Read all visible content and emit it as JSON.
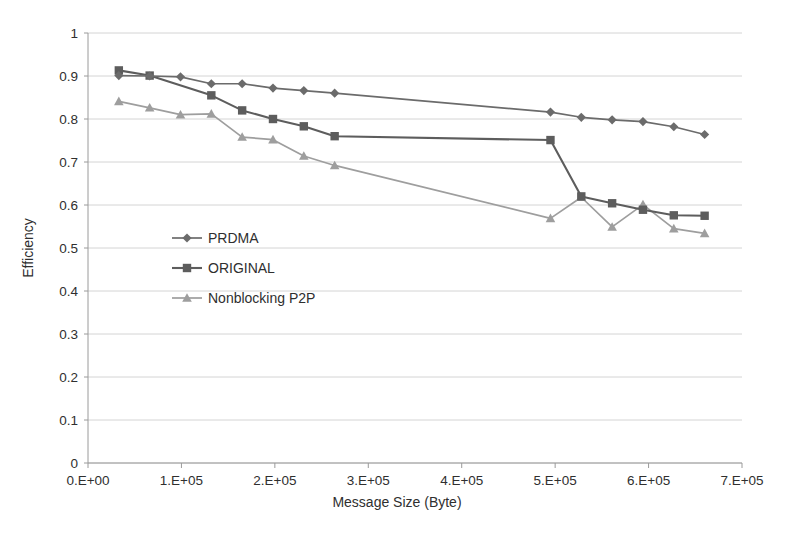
{
  "chart_data": {
    "type": "line",
    "title": "",
    "xlabel": "Message Size (Byte)",
    "ylabel": "Efficiency",
    "xlim": [
      0,
      700000
    ],
    "ylim": [
      0,
      1
    ],
    "grid": true,
    "legend_position": "inside-left-middle",
    "x_tick_labels": [
      "0.E+00",
      "1.E+05",
      "2.E+05",
      "3.E+05",
      "4.E+05",
      "5.E+05",
      "6.E+05",
      "7.E+05"
    ],
    "x_tick_values": [
      0,
      100000,
      200000,
      300000,
      400000,
      500000,
      600000,
      700000
    ],
    "y_tick_labels": [
      "0",
      "0.1",
      "0.2",
      "0.3",
      "0.4",
      "0.5",
      "0.6",
      "0.7",
      "0.8",
      "0.9",
      "1"
    ],
    "y_tick_values": [
      0,
      0.1,
      0.2,
      0.3,
      0.4,
      0.5,
      0.6,
      0.7,
      0.8,
      0.9,
      1
    ],
    "series": [
      {
        "name": "PRDMA",
        "marker": "diamond",
        "color": "#6b6b6b",
        "x": [
          33000,
          66000,
          99000,
          132000,
          165000,
          198000,
          231000,
          264000,
          495000,
          528000,
          561000,
          594000,
          627000,
          660000
        ],
        "values": [
          0.901,
          0.9,
          0.898,
          0.882,
          0.882,
          0.872,
          0.866,
          0.86,
          0.816,
          0.804,
          0.798,
          0.794,
          0.782,
          0.764
        ]
      },
      {
        "name": "ORIGINAL",
        "marker": "square",
        "color": "#5d5d5d",
        "x": [
          33000,
          66000,
          132000,
          165000,
          198000,
          231000,
          264000,
          495000,
          528000,
          561000,
          594000,
          627000,
          660000
        ],
        "values": [
          0.913,
          0.901,
          0.855,
          0.82,
          0.8,
          0.783,
          0.76,
          0.751,
          0.62,
          0.604,
          0.589,
          0.576,
          0.575
        ]
      },
      {
        "name": "Nonblocking P2P",
        "marker": "triangle",
        "color": "#9e9e9e",
        "x": [
          33000,
          66000,
          99000,
          132000,
          165000,
          198000,
          231000,
          264000,
          495000,
          528000,
          561000,
          594000,
          627000,
          660000
        ],
        "values": [
          0.841,
          0.826,
          0.81,
          0.812,
          0.758,
          0.752,
          0.714,
          0.692,
          0.569,
          0.618,
          0.549,
          0.601,
          0.545,
          0.534
        ]
      }
    ]
  },
  "legend": {
    "items": [
      {
        "label": "PRDMA"
      },
      {
        "label": "ORIGINAL"
      },
      {
        "label": "Nonblocking P2P"
      }
    ]
  }
}
